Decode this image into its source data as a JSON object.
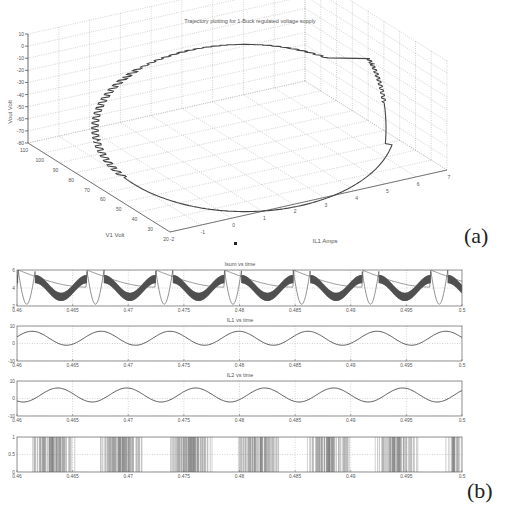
{
  "figure": {
    "panel_a_label": "(a)",
    "panel_b_label": "(b)"
  },
  "chart_data": [
    {
      "type": "line3d",
      "title": "Trajectory plotting for 1-Buck regulated voltage supply",
      "xlabel": "IL1 Amps",
      "ylabel": "V1 Volt",
      "zlabel": "Vout Volt",
      "x_ticks": [
        -2,
        -1,
        0,
        1,
        2,
        3,
        4,
        5,
        6,
        7
      ],
      "y_ticks": [
        110,
        100,
        90,
        80,
        70,
        60,
        50,
        40,
        30,
        20
      ],
      "z_ticks": [
        10,
        0,
        -10,
        -20,
        -30,
        -40,
        -50,
        -60,
        -70,
        -80
      ],
      "xlim": [
        -2,
        7
      ],
      "ylim": [
        20,
        110
      ],
      "zlim": [
        -80,
        10
      ],
      "grid": true,
      "description": "Closed limit-cycle trajectory with staircase (switching) ripple on the upper-left portion and smooth lower-right return"
    },
    {
      "type": "line",
      "title": "Isum vs time",
      "x_ticks": [
        "0.46",
        "0.465",
        "0.47",
        "0.475",
        "0.48",
        "0.485",
        "0.49",
        "0.495",
        "0.5"
      ],
      "y_ticks": [
        6,
        4,
        2
      ],
      "xlim": [
        0.46,
        0.5
      ],
      "ylim": [
        2,
        6
      ],
      "grid": true,
      "period": 0.005,
      "description": "Periodic waveform: dense switching band around 4 plus a smooth dip to ~2.2 each period, peak ~6"
    },
    {
      "type": "line",
      "title": "IL1 vs time",
      "x_ticks": [
        "0.46",
        "0.465",
        "0.47",
        "0.475",
        "0.48",
        "0.485",
        "0.49",
        "0.495",
        "0.5"
      ],
      "y_ticks": [
        10,
        0,
        -10
      ],
      "xlim": [
        0.46,
        0.5
      ],
      "ylim": [
        -10,
        10
      ],
      "grid": true,
      "series": [
        {
          "name": "IL1",
          "min": -1,
          "max": 7,
          "period": 0.0062
        }
      ]
    },
    {
      "type": "line",
      "title": "IL2 vs time",
      "x_ticks": [
        "0.46",
        "0.465",
        "0.47",
        "0.475",
        "0.48",
        "0.485",
        "0.49",
        "0.495",
        "0.5"
      ],
      "y_ticks": [
        10,
        0,
        -10
      ],
      "xlim": [
        0.46,
        0.5
      ],
      "ylim": [
        -10,
        10
      ],
      "grid": true,
      "series": [
        {
          "name": "IL2",
          "min": -2,
          "max": 6,
          "period": 0.0062
        }
      ]
    },
    {
      "type": "line",
      "title": "",
      "x_ticks": [
        "0.46",
        "0.465",
        "0.47",
        "0.475",
        "0.48",
        "0.485",
        "0.49",
        "0.495",
        "0.5"
      ],
      "y_ticks": [
        1,
        0.5,
        0
      ],
      "xlim": [
        0.46,
        0.5
      ],
      "ylim": [
        0,
        1
      ],
      "grid": true,
      "description": "Switching signal: bursts of dense 0/1 pulses about 0.004 s wide separated by ~0.0022 s gaps",
      "bursts": [
        [
          0.4612,
          0.4652
        ],
        [
          0.4674,
          0.4713
        ],
        [
          0.4737,
          0.4776
        ],
        [
          0.4799,
          0.4838
        ],
        [
          0.4861,
          0.4899
        ],
        [
          0.4922,
          0.4961
        ],
        [
          0.4985,
          0.5
        ]
      ]
    }
  ]
}
